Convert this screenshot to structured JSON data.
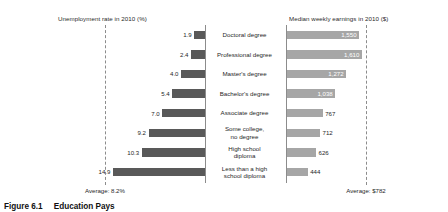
{
  "chart_data": {
    "type": "bar",
    "title": "Education Pays",
    "orientation": "horizontal-diverging",
    "categories": [
      "Doctoral degree",
      "Professional degree",
      "Master's degree",
      "Bachelor's degree",
      "Associate degree",
      "Some college,\nno degree",
      "High school\ndiploma",
      "Less than a high\nschool diploma"
    ],
    "series": [
      {
        "name": "Unemployment rate in 2010 (%)",
        "side": "left",
        "color": "#595959",
        "unit": "%",
        "values": [
          1.9,
          2.4,
          4.0,
          5.4,
          7.0,
          9.2,
          10.3,
          14.9
        ],
        "labels": [
          "1.9",
          "2.4",
          "4.0",
          "5.4",
          "7.0",
          "9.2",
          "10.3",
          "14.9"
        ],
        "axis_max": 16.0,
        "average": 8.2,
        "average_label": "Average: 8.2%"
      },
      {
        "name": "Median weekly earnings in 2010 ($)",
        "side": "right",
        "color": "#a6a6a6",
        "unit": "$",
        "values": [
          1550,
          1610,
          1272,
          1038,
          767,
          712,
          626,
          444
        ],
        "labels": [
          "1,550",
          "1,610",
          "1,272",
          "1,038",
          "767",
          "712",
          "626",
          "444"
        ],
        "label_positions": [
          "inside",
          "inside",
          "inside",
          "inside",
          "outside",
          "outside",
          "outside",
          "outside"
        ],
        "axis_max": 1700,
        "average": 782,
        "average_label": "Average: $782"
      }
    ],
    "grid": false,
    "legend": "none"
  },
  "titles": {
    "left_panel": "Unemployment rate in 2010 (%)",
    "right_panel": "Median weekly earnings in 2010 ($)"
  },
  "averages": {
    "left": "Average: 8.2%",
    "right": "Average: $782"
  },
  "caption": {
    "number": "Figure 6.1",
    "text": "Education Pays"
  }
}
